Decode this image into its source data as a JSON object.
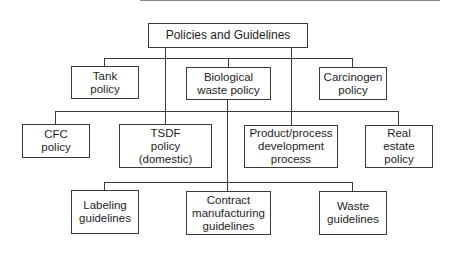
{
  "diagram": {
    "type": "org-chart",
    "title": "Policies and Guidelines",
    "root": {
      "label": "Policies and Guidelines"
    },
    "level1": [
      {
        "label": "Tank\npolicy"
      },
      {
        "label": "Biological\nwaste policy"
      },
      {
        "label": "Carcinogen\npolicy"
      }
    ],
    "level2": [
      {
        "label": "CFC\npolicy"
      },
      {
        "label": "TSDF\npolicy\n(domestic)"
      },
      {
        "label": "Product/process\ndevelopment\nprocess"
      },
      {
        "label": "Real\nestate\npolicy"
      }
    ],
    "level3": [
      {
        "label": "Labeling\nguidelines"
      },
      {
        "label": "Contract\nmanufacturing\nguidelines"
      },
      {
        "label": "Waste\nguidelines"
      }
    ],
    "colors": {
      "line": "#3a3a3a",
      "text": "#1e1e1e",
      "background": "#ffffff"
    }
  }
}
